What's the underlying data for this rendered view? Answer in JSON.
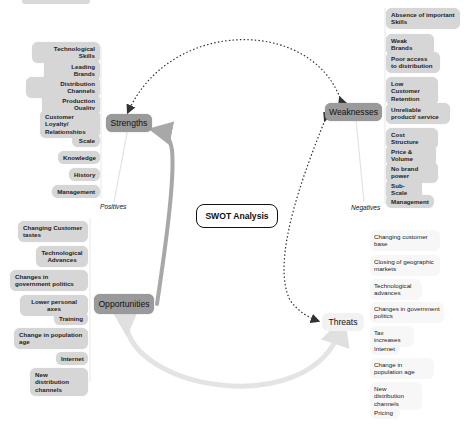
{
  "diagram": {
    "title": "SWOT Analysis",
    "colors": {
      "category_node": "#9a9a9a",
      "threat_node": "#f2f2f2",
      "item_pill": "#d6d6d6",
      "threat_pill": "#f7f7f7",
      "arrow_dark": "#333333",
      "arrow_gray": "#a8a8a8",
      "arrow_light": "#e4e4e4"
    },
    "annotations": {
      "positives": "Positives",
      "negatives": "Negatives"
    },
    "strengths": {
      "label": "Strengths",
      "items": [
        "Technological Skills",
        "Leading Brands",
        "Distribution Channels",
        "Production Quality",
        "Customer Loyalty/ Relationships",
        "Scale",
        "Knowledge",
        "History",
        "Management"
      ]
    },
    "weaknesses": {
      "label": "Weaknesses",
      "items": [
        "Absence of important Skills",
        "Weak Brands",
        "Poor access to distribution",
        "Low Customer Retention",
        "Unreliable product/ service",
        "Cost Structure",
        "Price & Volume",
        "No brand power",
        "Sub-Scale",
        "Management"
      ]
    },
    "opportunities": {
      "label": "Opportunities",
      "items": [
        "Changing Customer tastes",
        "Technological Advances",
        "Changes in government politics",
        "Lower personal axes",
        "Training",
        "Change in population age",
        "Internet",
        "New distribution channels"
      ]
    },
    "threats": {
      "label": "Threats",
      "items": [
        "Changing customer base",
        "Closing of geographic markets",
        "Technological advances",
        "Changes in government politics",
        "Tax increases",
        "Internet",
        "Change in population age",
        "New distribution channels",
        "Pricing"
      ]
    },
    "connections": [
      {
        "from": "Weaknesses",
        "to": "Strengths",
        "style": "dotted",
        "direction": "both"
      },
      {
        "from": "Threats",
        "to": "Weaknesses",
        "style": "dotted",
        "direction": "both"
      },
      {
        "from": "Opportunities",
        "to": "Strengths",
        "style": "thick-gray",
        "direction": "to-strengths"
      },
      {
        "from": "Threats",
        "to": "Opportunities",
        "style": "thick-light",
        "direction": "both"
      }
    ]
  }
}
